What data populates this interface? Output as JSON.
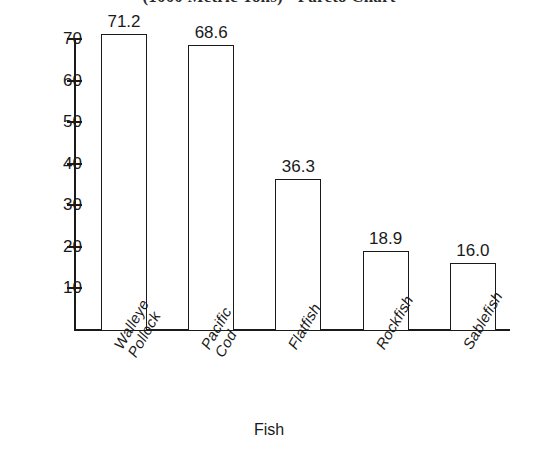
{
  "chart_data": {
    "type": "bar",
    "title": "(1000 Metric Tons) - Pareto Chart",
    "xlabel": "Fish",
    "ylabel": "",
    "categories": [
      "Walleye Pollock",
      "Pacific Cod",
      "Flatfish",
      "Rockfish",
      "Sablefish"
    ],
    "category_lines": [
      [
        "Walleye",
        "Pollock"
      ],
      [
        "Pacific",
        "Cod"
      ],
      [
        "Flatfish",
        ""
      ],
      [
        "Rockfish",
        ""
      ],
      [
        "Sablefish",
        ""
      ]
    ],
    "values": [
      71.2,
      68.6,
      36.3,
      18.9,
      16.0
    ],
    "value_labels": [
      "71.2",
      "68.6",
      "36.3",
      "18.9",
      "16.0"
    ],
    "ylim": [
      0,
      72
    ],
    "yticks": [
      70,
      60,
      50,
      40,
      30,
      20,
      10
    ],
    "ytick_labels": [
      "70",
      "60",
      "50",
      "40",
      "30",
      "20",
      "10"
    ],
    "grid": false,
    "legend": "none",
    "bar_fill_color": "#ffffff",
    "bar_edge_color": "#1a1a1a",
    "axis_color": "#1a1a1a",
    "background_color": "#ffffff"
  }
}
